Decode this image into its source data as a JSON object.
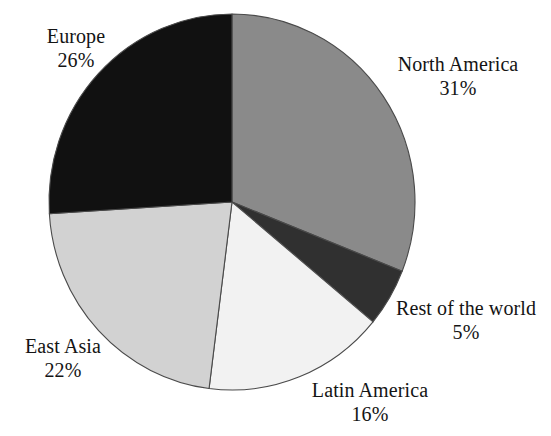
{
  "chart_data": {
    "type": "pie",
    "title": "",
    "subtitle": "",
    "xlabel": "",
    "ylabel": "",
    "legend_position": "none",
    "grid": false,
    "units": "percent",
    "total": 100,
    "start_angle_deg": 0,
    "direction": "clockwise",
    "categories": [
      "North America",
      "Rest of the world",
      "Latin America",
      "East Asia",
      "Europe"
    ],
    "values": [
      31,
      5,
      16,
      22,
      26
    ],
    "value_labels": [
      "31%",
      "5%",
      "16%",
      "22%",
      "26%"
    ],
    "colors": [
      "#8a8a8a",
      "#303030",
      "#f2f2f2",
      "#d2d2d2",
      "#111111"
    ],
    "slices": [
      {
        "name": "North America",
        "value": 31,
        "value_label": "31%",
        "color": "#8a8a8a",
        "start_deg": 0,
        "end_deg": 111.6
      },
      {
        "name": "Rest of the world",
        "value": 5,
        "value_label": "5%",
        "color": "#303030",
        "start_deg": 111.6,
        "end_deg": 129.6
      },
      {
        "name": "Latin America",
        "value": 16,
        "value_label": "16%",
        "color": "#f2f2f2",
        "start_deg": 129.6,
        "end_deg": 187.2
      },
      {
        "name": "East Asia",
        "value": 22,
        "value_label": "22%",
        "color": "#d2d2d2",
        "start_deg": 187.2,
        "end_deg": 266.4
      },
      {
        "name": "Europe",
        "value": 26,
        "value_label": "26%",
        "color": "#111111",
        "start_deg": 266.4,
        "end_deg": 360
      }
    ]
  },
  "labels": {
    "europe": {
      "name": "Europe",
      "value": "26%"
    },
    "north_america": {
      "name": "North America",
      "value": "31%"
    },
    "rest_of_the_world": {
      "name": "Rest of the world",
      "value": "5%"
    },
    "latin_america": {
      "name": "Latin America",
      "value": "16%"
    },
    "east_asia": {
      "name": "East Asia",
      "value": "22%"
    }
  },
  "geometry": {
    "center_x": 232,
    "center_y": 202,
    "radius_x": 183,
    "radius_y": 188,
    "stroke_color": "#4a4a4a"
  }
}
